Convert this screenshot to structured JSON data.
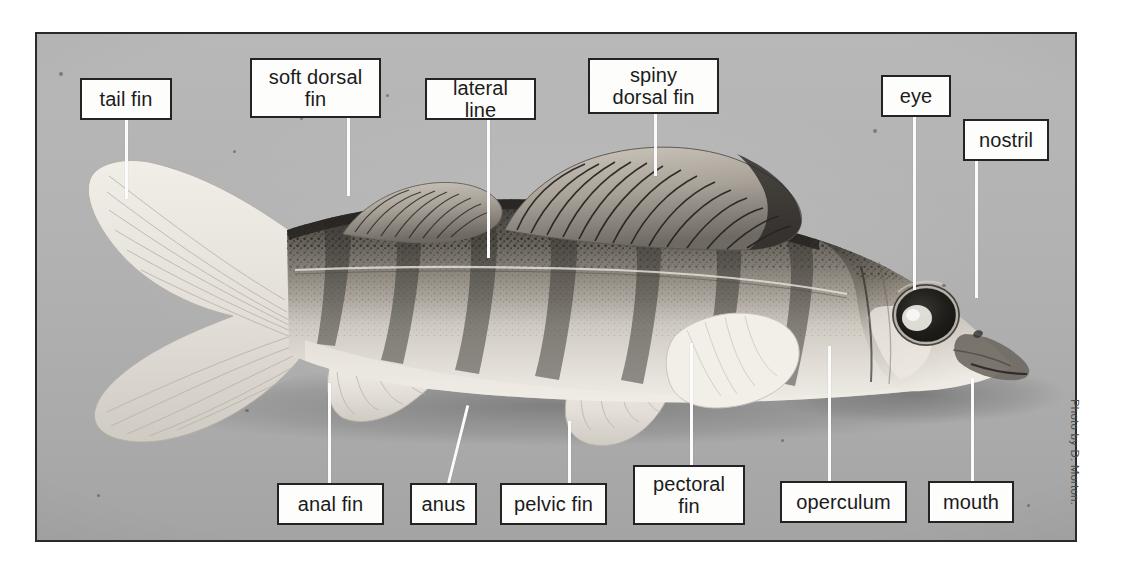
{
  "figure": {
    "kind": "labelled-photograph",
    "credit": "Photo by D. Morton.",
    "background_color": "#b3b3b3",
    "frame_color": "#2a2a2a",
    "label_box_fill": "#fdfdfb",
    "label_text_color": "#1b1b1b",
    "leader_color": "#fbfbfb"
  },
  "labels": [
    {
      "id": "tail-fin",
      "text": "tail fin",
      "x": 80,
      "y": 78,
      "w": 92,
      "h": 42,
      "leader": {
        "x": 125,
        "y1": 120,
        "y2": 199
      }
    },
    {
      "id": "soft-dorsal-fin",
      "text": "soft dorsal\nfin",
      "x": 250,
      "y": 58,
      "w": 131,
      "h": 60,
      "leader": {
        "x": 347,
        "y1": 118,
        "y2": 196
      }
    },
    {
      "id": "lateral-line",
      "text": "lateral line",
      "x": 425,
      "y": 78,
      "w": 111,
      "h": 42,
      "leader": {
        "x": 487,
        "y1": 120,
        "y2": 258
      }
    },
    {
      "id": "spiny-dorsal-fin",
      "text": "spiny\ndorsal fin",
      "x": 588,
      "y": 58,
      "w": 131,
      "h": 56,
      "leader": {
        "x": 654,
        "y1": 114,
        "y2": 176
      }
    },
    {
      "id": "eye",
      "text": "eye",
      "x": 881,
      "y": 75,
      "w": 70,
      "h": 42,
      "leader": {
        "x": 913,
        "y1": 117,
        "y2": 290
      }
    },
    {
      "id": "nostril",
      "text": "nostril",
      "x": 963,
      "y": 119,
      "w": 86,
      "h": 42,
      "leader": {
        "x": 975,
        "y1": 161,
        "y2": 298
      }
    },
    {
      "id": "anal-fin",
      "text": "anal fin",
      "x": 277,
      "y": 483,
      "w": 107,
      "h": 42,
      "leader": {
        "x": 328,
        "y1": 383,
        "y2": 483
      }
    },
    {
      "id": "anus",
      "text": "anus",
      "x": 410,
      "y": 483,
      "w": 67,
      "h": 42,
      "leader": {
        "x": 447,
        "y1": 403,
        "y2": 483,
        "slant": 14
      }
    },
    {
      "id": "pelvic-fin",
      "text": "pelvic fin",
      "x": 500,
      "y": 483,
      "w": 107,
      "h": 42,
      "leader": {
        "x": 568,
        "y1": 421,
        "y2": 483
      }
    },
    {
      "id": "pectoral-fin",
      "text": "pectoral\nfin",
      "x": 633,
      "y": 465,
      "w": 112,
      "h": 60,
      "leader": {
        "x": 690,
        "y1": 343,
        "y2": 465
      }
    },
    {
      "id": "operculum",
      "text": "operculum",
      "x": 780,
      "y": 481,
      "w": 127,
      "h": 42,
      "leader": {
        "x": 828,
        "y1": 346,
        "y2": 481
      }
    },
    {
      "id": "mouth",
      "text": "mouth",
      "x": 928,
      "y": 481,
      "w": 86,
      "h": 42,
      "leader": {
        "x": 971,
        "y1": 378,
        "y2": 481
      }
    }
  ]
}
